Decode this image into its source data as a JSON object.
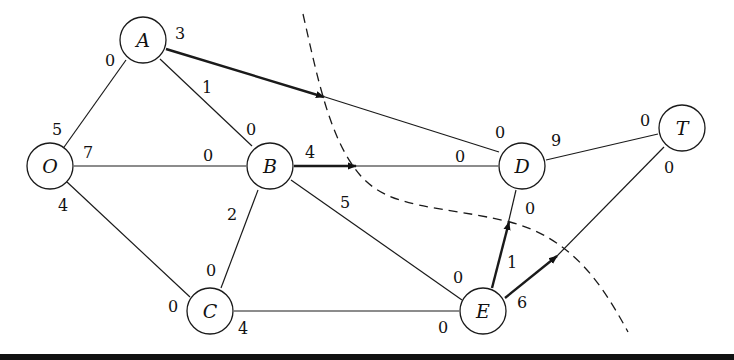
{
  "diagram": {
    "type": "network-flow",
    "nodes": [
      {
        "id": "O",
        "label": "O",
        "x": 50,
        "y": 166
      },
      {
        "id": "A",
        "label": "A",
        "x": 143,
        "y": 40
      },
      {
        "id": "B",
        "label": "B",
        "x": 270,
        "y": 166
      },
      {
        "id": "C",
        "label": "C",
        "x": 210,
        "y": 311
      },
      {
        "id": "D",
        "label": "D",
        "x": 522,
        "y": 166
      },
      {
        "id": "E",
        "label": "E",
        "x": 483,
        "y": 311
      },
      {
        "id": "T",
        "label": "T",
        "x": 682,
        "y": 128
      }
    ],
    "edges": [
      {
        "from": "O",
        "to": "A",
        "cap_from": "5",
        "cap_to": "0",
        "flow_arrow": false
      },
      {
        "from": "O",
        "to": "B",
        "cap_from": "7",
        "cap_to": "0",
        "flow_arrow": false
      },
      {
        "from": "O",
        "to": "C",
        "cap_from": "4",
        "cap_to": "0",
        "flow_arrow": false
      },
      {
        "from": "A",
        "to": "B",
        "cap_from": "1",
        "cap_to": "0",
        "flow_arrow": false
      },
      {
        "from": "A",
        "to": "D",
        "cap_from": "3",
        "cap_to": "0",
        "flow_arrow": true
      },
      {
        "from": "B",
        "to": "C",
        "cap_from": "2",
        "cap_to": "0",
        "flow_arrow": false
      },
      {
        "from": "B",
        "to": "D",
        "cap_from": "4",
        "cap_to": "0",
        "flow_arrow": true
      },
      {
        "from": "B",
        "to": "E",
        "cap_from": "5",
        "cap_to": "0",
        "flow_arrow": false
      },
      {
        "from": "C",
        "to": "E",
        "cap_from": "4",
        "cap_to": "0",
        "flow_arrow": false
      },
      {
        "from": "E",
        "to": "D",
        "cap_from": "1",
        "cap_to": "0",
        "flow_arrow": true
      },
      {
        "from": "D",
        "to": "T",
        "cap_from": "9",
        "cap_to": "0",
        "flow_arrow": false
      },
      {
        "from": "E",
        "to": "T",
        "cap_from": "6",
        "cap_to": "0",
        "flow_arrow": true
      }
    ],
    "cut": {
      "style": "dashed",
      "description": "cut separating {O,A,B,C,E} from {D,T}"
    }
  }
}
